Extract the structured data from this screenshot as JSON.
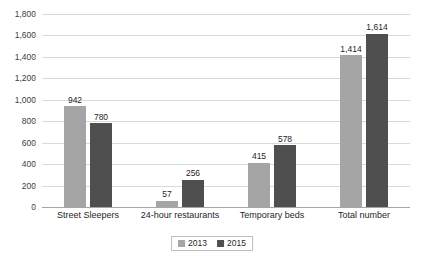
{
  "chart_data": {
    "type": "bar",
    "title": "",
    "subtitle": "",
    "xlabel": "",
    "ylabel": "",
    "categories": [
      "Street Sleepers",
      "24-hour restaurants",
      "Temporary beds",
      "Total number"
    ],
    "series": [
      {
        "name": "2013",
        "color": "#a5a5a5",
        "values": [
          942,
          57,
          415,
          1414
        ]
      },
      {
        "name": "2015",
        "color": "#4f4f4f",
        "values": [
          780,
          256,
          578,
          1614
        ]
      }
    ],
    "data_labels": [
      [
        "942",
        "57",
        "415",
        "1,414"
      ],
      [
        "780",
        "256",
        "578",
        "1,614"
      ]
    ],
    "ylim": [
      0,
      1800
    ],
    "ytick_step": 200,
    "ytick_labels": [
      "0",
      "200",
      "400",
      "600",
      "800",
      "1,000",
      "1,200",
      "1,400",
      "1,600",
      "1,800"
    ],
    "ytick_values": [
      0,
      200,
      400,
      600,
      800,
      1000,
      1200,
      1400,
      1600,
      1800
    ],
    "grid": true,
    "grid_color": "#d9d9d9",
    "axis_color": "#a6a6a6",
    "legend_position": "bottom",
    "background": "#ffffff"
  },
  "legend": {
    "entries": [
      {
        "label": "2013"
      },
      {
        "label": "2015"
      }
    ]
  }
}
